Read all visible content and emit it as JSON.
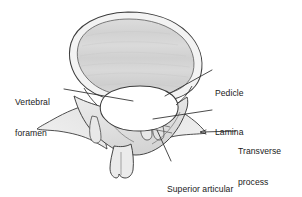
{
  "figure": {
    "background_color": "#ffffff",
    "outline_color": "#3c3c3c",
    "body_fill": "#d6d6d6",
    "cortical_fill": "#efefef",
    "arch_fill": "#e4e4e4",
    "foramen_fill": "#ffffff",
    "label_color": "#1a1a1a",
    "leader_color": "#2b2b2b"
  },
  "labels": {
    "vertebral_foramen": {
      "line1": "Vertebral",
      "line2": "foramen"
    },
    "pedicle": {
      "line1": "Pedicle"
    },
    "lamina": {
      "line1": "Lamina"
    },
    "transverse_process": {
      "line1": "Transverse",
      "line2": "process"
    },
    "superior_articular_process": {
      "line1": "Superior articular",
      "line2": "process"
    }
  }
}
